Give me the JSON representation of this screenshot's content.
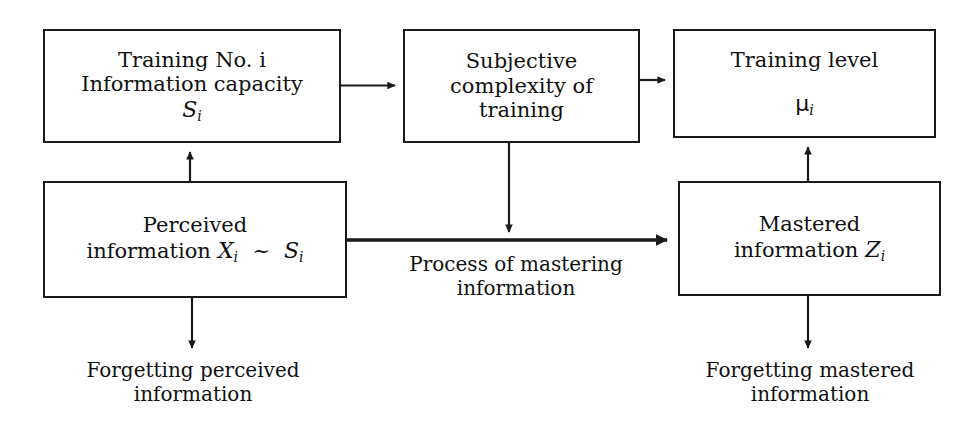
{
  "diagram": {
    "type": "flow-diagram",
    "background_color": "#ffffff",
    "line_color": "#1a1a1a",
    "nodes": [
      {
        "id": "training-capacity",
        "lines": [
          "Training No. i",
          "Information capacity"
        ],
        "symbol": "S",
        "symbol_subscript": "i"
      },
      {
        "id": "subjective-complexity",
        "lines": [
          "Subjective",
          "complexity of",
          "training"
        ],
        "symbol": "",
        "symbol_subscript": ""
      },
      {
        "id": "training-level",
        "lines": [
          "Training level"
        ],
        "symbol": "μ",
        "symbol_subscript": "i"
      },
      {
        "id": "perceived-information",
        "lines": [
          "Perceived"
        ],
        "inline_line": {
          "text": "information",
          "symbol_a": "X",
          "symbol_a_subscript": "i",
          "relation": "~",
          "symbol_b": "S",
          "symbol_b_subscript": "i"
        }
      },
      {
        "id": "mastered-information",
        "lines": [
          "Mastered"
        ],
        "inline_line": {
          "text": "information",
          "symbol_a": "Z",
          "symbol_a_subscript": "i"
        }
      }
    ],
    "labels": [
      {
        "id": "process-of-mastering",
        "text": "Process of mastering\ninformation"
      },
      {
        "id": "forgetting-perceived",
        "text": "Forgetting perceived\ninformation"
      },
      {
        "id": "forgetting-mastered",
        "text": "Forgetting mastered\ninformation"
      }
    ],
    "edges": [
      {
        "id": "capacity-to-subjective",
        "from": "training-capacity",
        "to": "subjective-complexity",
        "direction": "right"
      },
      {
        "id": "subjective-to-level",
        "from": "subjective-complexity",
        "to": "training-level",
        "direction": "right"
      },
      {
        "id": "perceived-to-capacity",
        "from": "perceived-information",
        "to": "training-capacity",
        "direction": "up"
      },
      {
        "id": "subjective-to-mastering",
        "from": "subjective-complexity",
        "to": "process-of-mastering",
        "direction": "down"
      },
      {
        "id": "perceived-to-mastered",
        "from": "perceived-information",
        "to": "mastered-information",
        "direction": "right",
        "emphasis": "thick"
      },
      {
        "id": "mastered-to-level",
        "from": "mastered-information",
        "to": "training-level",
        "direction": "up"
      },
      {
        "id": "perceived-to-forgetting",
        "from": "perceived-information",
        "to": "forgetting-perceived",
        "direction": "down"
      },
      {
        "id": "mastered-to-forgetting",
        "from": "mastered-information",
        "to": "forgetting-mastered",
        "direction": "down"
      }
    ]
  }
}
